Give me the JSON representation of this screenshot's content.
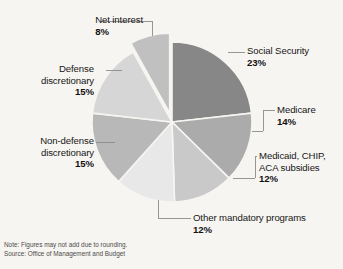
{
  "figure": {
    "background_color": "#f7f5f1",
    "footnote": {
      "note": "Note: Figures may not add due to rounding.",
      "source": "Source: Office of Management and Budget"
    }
  },
  "chart_data": {
    "type": "pie",
    "title": "",
    "subtitle": "",
    "xlabel": "",
    "ylabel": "",
    "legend_position": "callout-labels",
    "grid": false,
    "units": "percent",
    "total": 99,
    "start_angle_deg": 0,
    "direction": "clockwise",
    "categories": [
      "Social Security",
      "Medicare",
      "Medicaid, CHIP, ACA subsidies",
      "Other mandatory programs",
      "Non-defense discretionary",
      "Defense discretionary",
      "Net interest"
    ],
    "values": [
      23,
      14,
      12,
      12,
      15,
      15,
      8
    ],
    "value_labels": [
      "23%",
      "14%",
      "12%",
      "12%",
      "15%",
      "15%",
      "8%"
    ],
    "colors": [
      "#878787",
      "#ababab",
      "#c9c9c9",
      "#e8e8e8",
      "#b8b8b8",
      "#d6d6d6",
      "#c0c0c0"
    ],
    "exploded": [
      false,
      false,
      false,
      false,
      false,
      false,
      true
    ],
    "slices": [
      {
        "label": "Social Security",
        "pct_label": "23%",
        "value": 23,
        "color": "#878787"
      },
      {
        "label": "Medicare",
        "pct_label": "14%",
        "value": 14,
        "color": "#ababab"
      },
      {
        "label_line1": "Medicaid, CHIP,",
        "label_line2": "ACA subsidies",
        "pct_label": "12%",
        "value": 12,
        "color": "#c9c9c9"
      },
      {
        "label": "Other mandatory programs",
        "pct_label": "12%",
        "value": 12,
        "color": "#e8e8e8"
      },
      {
        "label_line1": "Non-defense",
        "label_line2": "discretionary",
        "pct_label": "15%",
        "value": 15,
        "color": "#b8b8b8"
      },
      {
        "label_line1": "Defense",
        "label_line2": "discretionary",
        "pct_label": "15%",
        "value": 15,
        "color": "#d6d6d6"
      },
      {
        "label": "Net interest",
        "pct_label": "8%",
        "value": 8,
        "color": "#c0c0c0"
      }
    ]
  },
  "labels": {
    "social_security": {
      "name": "Social Security",
      "pct": "23%"
    },
    "medicare": {
      "name": "Medicare",
      "pct": "14%"
    },
    "medicaid": {
      "line1": "Medicaid, CHIP,",
      "line2": "ACA subsidies",
      "pct": "12%"
    },
    "other_mandatory": {
      "name": "Other mandatory programs",
      "pct": "12%"
    },
    "non_defense": {
      "line1": "Non-defense",
      "line2": "discretionary",
      "pct": "15%"
    },
    "defense": {
      "line1": "Defense",
      "line2": "discretionary",
      "pct": "15%"
    },
    "net_interest": {
      "name": "Net interest",
      "pct": "8%"
    }
  }
}
